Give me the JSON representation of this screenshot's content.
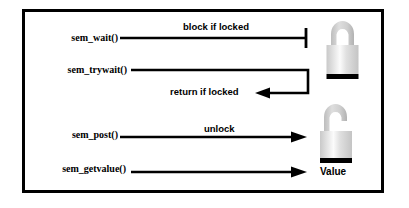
{
  "figure": {
    "background_color": "#ffffff",
    "border_color": "#000000"
  },
  "operations": [
    {
      "name": "sem-wait",
      "label": "sem_wait()",
      "annotation": "block if locked",
      "arrow_style": "blocked-tee",
      "target": "closed-padlock"
    },
    {
      "name": "sem-trywait",
      "label": "sem_trywait()",
      "annotation": "return if locked",
      "arrow_style": "return-elbow",
      "target": "closed-padlock"
    },
    {
      "name": "sem-post",
      "label": "sem_post()",
      "annotation": "unlock",
      "arrow_style": "arrowhead",
      "target": "open-padlock"
    },
    {
      "name": "sem-getvalue",
      "label": "sem_getvalue()",
      "annotation": "",
      "arrow_style": "arrowhead",
      "target": "value-text"
    }
  ],
  "targets": {
    "value_label": "Value",
    "closed_padlock_icon": "padlock-closed-icon",
    "open_padlock_icon": "padlock-open-icon"
  },
  "colors": {
    "line": "#000000",
    "lock_shackle_light": "#d6d6d6",
    "lock_shackle_dark": "#b4b4b4",
    "lock_body_left": "#c9c9c9",
    "lock_body_highlight": "#fbfbfb",
    "lock_body_right": "#c4c4c4",
    "lock_base": "#000000"
  }
}
